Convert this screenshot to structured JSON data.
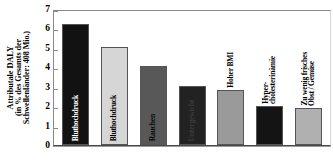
{
  "chart_data": {
    "type": "bar",
    "title": "",
    "xlabel": "",
    "ylabel": "Attributale DALY (in % des Gesamts der Schwellenländer: 408 Mio.)",
    "ylabel_lines": [
      "Attributale DALY",
      "(in % des Gesamts der",
      "Schwellenländer: 408 Mio.)"
    ],
    "ylim": [
      0,
      7
    ],
    "ytick_labels": [
      "7",
      "6",
      "5",
      "4",
      "3",
      "2",
      "1",
      "0"
    ],
    "ytick_values": [
      7,
      6,
      5,
      4,
      3,
      2,
      1,
      0
    ],
    "grid": false,
    "legend": "none",
    "categories": [
      "Bluthochdruck",
      "Bluthochdruck",
      "Rauchen",
      "Untergewicht",
      "Hoher BMI",
      "Hyper-cholesterinämie",
      "Zu wenig frisches Obst / Gemüse"
    ],
    "values": [
      6.25,
      5.05,
      4.05,
      3.05,
      2.85,
      2.0,
      1.93
    ],
    "bars": [
      {
        "label": "Bluthochdruck",
        "label_lines": [
          "Bluthochdruck"
        ],
        "value": 6.25,
        "fill": "#121212",
        "text_color": "#ffffff",
        "label_placement": "inside"
      },
      {
        "label": "Bluthochdruck",
        "label_lines": [
          "Bluthochdruck"
        ],
        "value": 5.05,
        "fill": "#d6d6d6",
        "text_color": "#000000",
        "label_placement": "inside"
      },
      {
        "label": "Rauchen",
        "label_lines": [
          "Rauchen"
        ],
        "value": 4.05,
        "fill": "#585858",
        "text_color": "#0a0a0a",
        "label_placement": "inside"
      },
      {
        "label": "Untergewicht",
        "label_lines": [
          "Untergewicht"
        ],
        "value": 3.05,
        "fill": "#222222",
        "text_color": "#3a3a3a",
        "label_placement": "inside"
      },
      {
        "label": "Hoher BMI",
        "label_lines": [
          "Hoher BMI"
        ],
        "value": 2.85,
        "fill": "#9a9a9a",
        "text_color": "#000000",
        "label_placement": "above"
      },
      {
        "label": "Hyper-cholesterinämie",
        "label_lines": [
          "Hyper-",
          "cholesterinämie"
        ],
        "value": 2.0,
        "fill": "#141414",
        "text_color": "#000000",
        "label_placement": "above"
      },
      {
        "label": "Zu wenig frisches Obst / Gemüse",
        "label_lines": [
          "Zu wenig frisches",
          "Obst / Gemüse"
        ],
        "value": 1.93,
        "fill": "#b0b0b0",
        "text_color": "#000000",
        "label_placement": "above"
      }
    ]
  }
}
